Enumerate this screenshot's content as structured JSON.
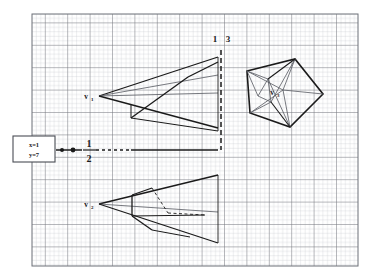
{
  "figure": {
    "type": "geometry-diagram",
    "background": "#ffffff",
    "grid": {
      "x": 32,
      "y": 14,
      "width": 326,
      "height": 252,
      "minor_step": 4.48,
      "major_step": 22.4,
      "minor_color": "#b9bcc4",
      "major_color": "#6d7078",
      "border_color": "#6d7078"
    },
    "ink_color": "#1a1a1a",
    "thin_color": "#555860"
  },
  "annotations": {
    "callout_box": {
      "line1": "x=1",
      "line2": "y=7",
      "x": 13,
      "y": 136,
      "width": 42,
      "height": 26,
      "border_color": "#4a4d55",
      "fill": "#ffffff"
    },
    "vertex_labels": [
      {
        "name": "v1",
        "base": "v",
        "sub": "1",
        "x": 86,
        "y": 99
      },
      {
        "name": "v2",
        "base": "v",
        "sub": "2",
        "x": 86,
        "y": 207
      },
      {
        "name": "v3",
        "base": "v",
        "sub": "3",
        "x": 272,
        "y": 95
      }
    ],
    "axis_labels": [
      {
        "name": "label-one",
        "text": "1",
        "x": 215,
        "y": 42
      },
      {
        "name": "label-three",
        "text": "3",
        "x": 228,
        "y": 42
      }
    ],
    "fraction_label": {
      "numerator": "1",
      "denominator": "2",
      "x": 89,
      "y_num": 147,
      "y_den": 161,
      "bar_y": 150,
      "bar_x1": 83,
      "bar_x2": 96
    },
    "axis_dots": [
      {
        "name": "axis-dot-left",
        "cx": 62,
        "cy": 150,
        "r": 2.0
      },
      {
        "name": "axis-dot-right",
        "cx": 73,
        "cy": 150,
        "r": 2.4
      }
    ]
  },
  "geometry": {
    "horizontal_axis": {
      "name": "horizontal-axis-line",
      "solid_x1": 56,
      "solid_x2": 82,
      "dash_x1": 96,
      "dash_x2": 131,
      "solid2_x1": 131,
      "solid2_x2": 218,
      "y": 150
    },
    "vertical_dashed": {
      "name": "vertical-dashed-line",
      "x": 221,
      "y1": 50,
      "y2": 150
    },
    "cone_upper": {
      "name": "cone-upper-v1",
      "apex": [
        99,
        96
      ],
      "rays": [
        [
          99,
          96,
          218,
          57
        ],
        [
          99,
          96,
          218,
          75
        ],
        [
          99,
          96,
          218,
          93
        ],
        [
          99,
          96,
          218,
          128
        ]
      ],
      "polygon_edges": [
        [
          131,
          118,
          188,
          77
        ],
        [
          188,
          77,
          218,
          62
        ],
        [
          131,
          118,
          218,
          131
        ],
        [
          131,
          118,
          131,
          104
        ]
      ]
    },
    "cone_lower": {
      "name": "cone-lower-v2",
      "apex": [
        99,
        204
      ],
      "rays": [
        [
          99,
          204,
          218,
          175
        ],
        [
          99,
          204,
          218,
          212
        ],
        [
          99,
          204,
          218,
          243
        ],
        [
          99,
          204,
          218,
          204
        ]
      ],
      "polygon_edges": [
        [
          132,
          216,
          132,
          195
        ],
        [
          132,
          195,
          152,
          188
        ],
        [
          132,
          216,
          152,
          230
        ],
        [
          152,
          230,
          190,
          237
        ],
        [
          132,
          216,
          205,
          215
        ]
      ],
      "dashed_edges": [
        [
          152,
          188,
          168,
          213
        ],
        [
          168,
          213,
          205,
          215
        ]
      ]
    },
    "pentagon": {
      "name": "pentagon-v3",
      "outline": [
        [
          247,
          71
        ],
        [
          295,
          59
        ],
        [
          323,
          94
        ],
        [
          290,
          127
        ],
        [
          250,
          113
        ]
      ],
      "inner_nodes": [
        [
          283,
          90
        ],
        [
          268,
          79
        ],
        [
          271,
          102
        ],
        [
          258,
          96
        ]
      ],
      "inner_edges": [
        [
          247,
          71,
          283,
          90
        ],
        [
          295,
          59,
          283,
          90
        ],
        [
          323,
          94,
          283,
          90
        ],
        [
          290,
          127,
          283,
          90
        ],
        [
          250,
          113,
          283,
          90
        ],
        [
          247,
          71,
          268,
          79
        ],
        [
          268,
          79,
          271,
          102
        ],
        [
          271,
          102,
          250,
          113
        ],
        [
          258,
          96,
          268,
          79
        ],
        [
          258,
          96,
          271,
          102
        ],
        [
          258,
          96,
          247,
          71
        ],
        [
          295,
          59,
          271,
          102
        ],
        [
          290,
          127,
          268,
          79
        ]
      ]
    }
  }
}
